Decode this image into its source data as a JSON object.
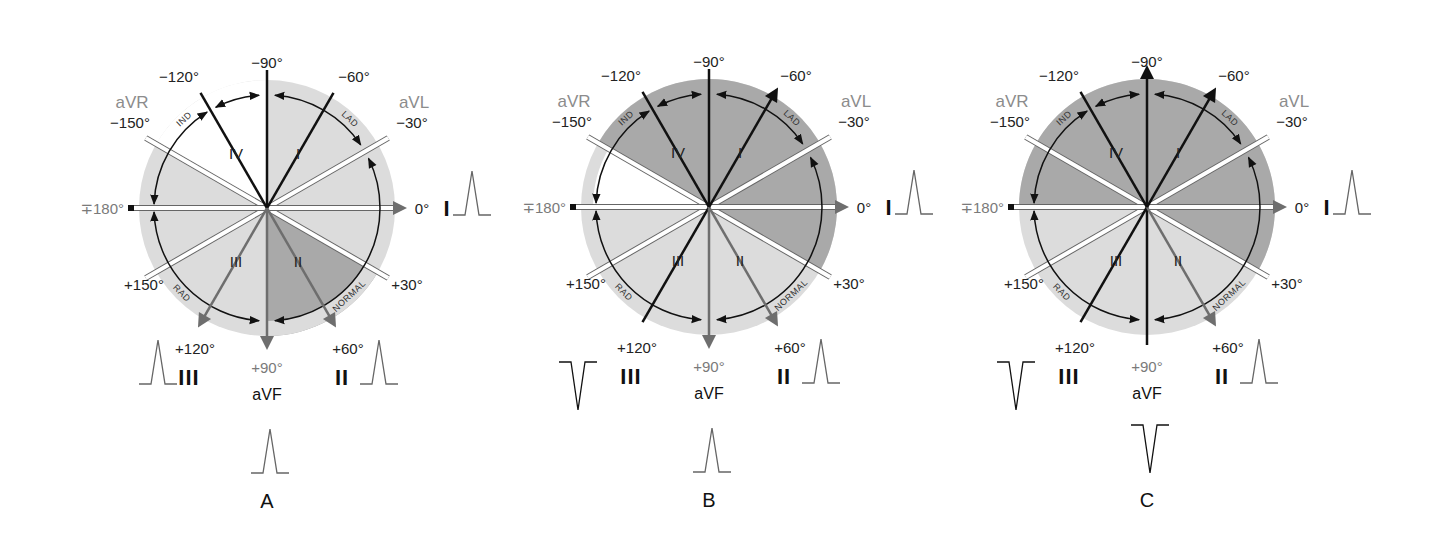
{
  "figure": {
    "panels": [
      {
        "id": "A",
        "label": "A",
        "center": [
          267,
          208
        ],
        "shading": {
          "base": "light",
          "white_from": -150,
          "white_to": -90,
          "dark_from": 30,
          "dark_to": 90
        },
        "highlight_leads": {
          "gray_arrows": [
            0,
            60,
            90,
            120
          ],
          "black_lines": [
            -120,
            -90,
            -60
          ]
        },
        "waveforms": {
          "lead_I": "upright",
          "lead_II": "upright",
          "lead_III": "upright",
          "aVF": "upright"
        }
      },
      {
        "id": "B",
        "label": "B",
        "center": [
          709,
          207
        ],
        "shading": {
          "base": "light",
          "white_from": -180,
          "white_to": -150,
          "dark_from": -150,
          "dark_to": 30
        },
        "highlight_leads": {
          "gray_arrows": [
            0,
            60,
            90
          ],
          "black_arrows": [
            -60
          ],
          "black_lines": [
            -120,
            -90,
            120
          ]
        },
        "waveforms": {
          "lead_I": "upright",
          "lead_II": "upright",
          "lead_III": "inverted",
          "aVF": "upright"
        }
      },
      {
        "id": "C",
        "label": "C",
        "center": [
          1147,
          207
        ],
        "shading": {
          "base": "light",
          "dark_from": -180,
          "dark_to": 30
        },
        "highlight_leads": {
          "gray_arrows": [
            0,
            60
          ],
          "black_arrows": [
            -90,
            -60
          ],
          "black_lines": [
            -120,
            90,
            120
          ]
        },
        "waveforms": {
          "lead_I": "upright",
          "lead_II": "upright",
          "lead_III": "inverted",
          "aVF": "inverted"
        }
      }
    ],
    "degree_labels": {
      "m90": "−90°",
      "m120": "−120°",
      "m60": "−60°",
      "m150": "−150°",
      "m30": "−30°",
      "p180": "∓180°",
      "zero": "0°",
      "p150": "+150°",
      "p30": "+30°",
      "p120": "+120°",
      "p90": "+90°",
      "p60": "+60°"
    },
    "lead_labels": {
      "aVR": "aVR",
      "aVL": "aVL",
      "I": "I",
      "II": "II",
      "III": "III",
      "aVF": "aVF"
    },
    "quadrant_labels": {
      "q1": "I",
      "q2": "II",
      "q3": "III",
      "q4": "IV"
    },
    "arc_labels": {
      "ind": "IND",
      "lad": "LAD",
      "rad": "RAD",
      "normal": "NORMAL"
    },
    "colors": {
      "disk_light": "#dcdcdc",
      "disk_dark": "#a9a9a9",
      "white": "#ffffff",
      "lead_gray": "#6e6e6e",
      "lead_black": "#111111",
      "arc": "#111111",
      "label_gray": "#8a8a8a"
    }
  }
}
